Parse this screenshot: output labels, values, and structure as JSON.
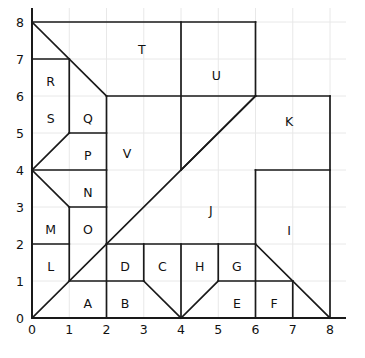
{
  "figure": {
    "title": "",
    "type": "partition-diagram",
    "background_color": "#ffffff",
    "line_color": "#1a1a1a",
    "grid_color": "#e8e8e8",
    "label_color": "#111111"
  },
  "axes": {
    "x": {
      "min": 0,
      "max": 8,
      "ticks": [
        0,
        1,
        2,
        3,
        4,
        5,
        6,
        7,
        8
      ],
      "tick_labels": [
        "0",
        "1",
        "2",
        "3",
        "4",
        "5",
        "6",
        "7",
        "8"
      ],
      "label": ""
    },
    "y": {
      "min": 0,
      "max": 8,
      "ticks": [
        0,
        1,
        2,
        3,
        4,
        5,
        6,
        7,
        8
      ],
      "tick_labels": [
        "0",
        "1",
        "2",
        "3",
        "4",
        "5",
        "6",
        "7",
        "8"
      ],
      "label": ""
    },
    "grid": true
  },
  "chart_data": {
    "type": "diagram",
    "title": "",
    "xlabel": "",
    "ylabel": "",
    "xlim": [
      0,
      8
    ],
    "ylim": [
      0,
      8
    ],
    "grid": true,
    "regions": [
      {
        "id": "A",
        "label": "A",
        "label_x": 1.5,
        "label_y": 0.5,
        "polygon": [
          [
            1,
            1
          ],
          [
            2,
            1
          ],
          [
            2,
            0
          ],
          [
            1,
            0
          ]
        ]
      },
      {
        "id": "B",
        "label": "B",
        "label_x": 2.5,
        "label_y": 0.5,
        "polygon": [
          [
            2,
            1
          ],
          [
            3,
            1
          ],
          [
            3,
            0
          ],
          [
            2,
            0
          ]
        ]
      },
      {
        "id": "C",
        "label": "C",
        "label_x": 3.5,
        "label_y": 1.5,
        "polygon": [
          [
            3,
            2
          ],
          [
            4,
            2
          ],
          [
            4,
            0
          ],
          [
            3,
            1
          ]
        ]
      },
      {
        "id": "D",
        "label": "D",
        "label_x": 2.5,
        "label_y": 1.5,
        "polygon": [
          [
            2,
            2
          ],
          [
            3,
            2
          ],
          [
            3,
            1
          ],
          [
            2,
            1
          ]
        ]
      },
      {
        "id": "E",
        "label": "E",
        "label_x": 5.5,
        "label_y": 0.5,
        "polygon": [
          [
            5,
            1
          ],
          [
            6,
            1
          ],
          [
            6,
            0
          ],
          [
            5,
            0
          ]
        ]
      },
      {
        "id": "F",
        "label": "F",
        "label_x": 6.5,
        "label_y": 0.5,
        "polygon": [
          [
            6,
            1
          ],
          [
            7,
            1
          ],
          [
            7,
            0
          ],
          [
            6,
            0
          ]
        ]
      },
      {
        "id": "G",
        "label": "G",
        "label_x": 5.5,
        "label_y": 1.5,
        "polygon": [
          [
            5,
            2
          ],
          [
            6,
            2
          ],
          [
            6,
            1
          ],
          [
            5,
            1
          ]
        ]
      },
      {
        "id": "H",
        "label": "H",
        "label_x": 4.5,
        "label_y": 1.5,
        "polygon": [
          [
            4,
            2
          ],
          [
            5,
            2
          ],
          [
            5,
            1
          ],
          [
            4,
            0
          ]
        ]
      },
      {
        "id": "I",
        "label": "I",
        "label_x": 6.9,
        "label_y": 2.45,
        "polygon": [
          [
            6,
            4
          ],
          [
            8,
            4
          ],
          [
            8,
            0
          ],
          [
            6,
            2
          ]
        ]
      },
      {
        "id": "J",
        "label": "J",
        "label_x": 4.8,
        "label_y": 3.0,
        "polygon": [
          [
            4,
            4
          ],
          [
            6,
            4
          ],
          [
            6,
            2
          ],
          [
            2,
            2
          ]
        ]
      },
      {
        "id": "K",
        "label": "K",
        "label_x": 6.9,
        "label_y": 5.4,
        "polygon": [
          [
            6,
            6
          ],
          [
            8,
            6
          ],
          [
            8,
            4
          ],
          [
            6,
            4
          ]
        ]
      },
      {
        "id": "L",
        "label": "L",
        "label_x": 0.5,
        "label_y": 1.5,
        "polygon": [
          [
            0,
            2
          ],
          [
            1,
            2
          ],
          [
            1,
            1
          ],
          [
            0,
            0
          ]
        ]
      },
      {
        "id": "M",
        "label": "M",
        "label_x": 0.5,
        "label_y": 2.5,
        "polygon": [
          [
            0,
            3
          ],
          [
            1,
            3
          ],
          [
            1,
            2
          ],
          [
            0,
            2
          ]
        ]
      },
      {
        "id": "N",
        "label": "N",
        "label_x": 1.5,
        "label_y": 3.5,
        "polygon": [
          [
            1,
            4
          ],
          [
            2,
            4
          ],
          [
            2,
            3
          ],
          [
            1,
            3
          ]
        ]
      },
      {
        "id": "O",
        "label": "O",
        "label_x": 1.5,
        "label_y": 2.5,
        "polygon": [
          [
            1,
            3
          ],
          [
            2,
            3
          ],
          [
            2,
            2
          ],
          [
            1,
            2
          ]
        ]
      },
      {
        "id": "P",
        "label": "P",
        "label_x": 1.5,
        "label_y": 4.5,
        "polygon": [
          [
            1,
            5
          ],
          [
            2,
            5
          ],
          [
            2,
            4
          ],
          [
            1,
            4
          ]
        ]
      },
      {
        "id": "Q",
        "label": "Q",
        "label_x": 1.5,
        "label_y": 5.5,
        "polygon": [
          [
            1,
            6
          ],
          [
            2,
            6
          ],
          [
            2,
            5
          ],
          [
            1,
            5
          ]
        ]
      },
      {
        "id": "R",
        "label": "R",
        "label_x": 0.5,
        "label_y": 6.5,
        "polygon": [
          [
            0,
            7
          ],
          [
            1,
            7
          ],
          [
            1,
            6
          ],
          [
            0,
            6
          ]
        ]
      },
      {
        "id": "S",
        "label": "S",
        "label_x": 0.5,
        "label_y": 5.5,
        "polygon": [
          [
            0,
            6
          ],
          [
            1,
            6
          ],
          [
            1,
            5
          ],
          [
            0,
            4
          ]
        ]
      },
      {
        "id": "T",
        "label": "T",
        "label_x": 2.95,
        "label_y": 7.35,
        "polygon": [
          [
            0,
            8
          ],
          [
            6,
            8
          ],
          [
            6,
            6
          ],
          [
            2,
            6
          ]
        ]
      },
      {
        "id": "U",
        "label": "U",
        "label_x": 4.95,
        "label_y": 6.65,
        "polygon": [
          [
            4,
            8
          ],
          [
            6,
            8
          ],
          [
            6,
            6
          ],
          [
            4,
            6
          ]
        ]
      },
      {
        "id": "V",
        "label": "V",
        "label_x": 2.55,
        "label_y": 4.55,
        "polygon": [
          [
            2,
            6
          ],
          [
            4,
            6
          ],
          [
            4,
            4
          ],
          [
            2,
            2
          ]
        ]
      }
    ],
    "segments": [
      {
        "name": "left-border",
        "from": [
          0,
          0
        ],
        "to": [
          0,
          8
        ]
      },
      {
        "name": "bottom-border",
        "from": [
          0,
          0
        ],
        "to": [
          8,
          0
        ]
      },
      {
        "name": "top-border",
        "from": [
          0,
          8
        ],
        "to": [
          6,
          8
        ]
      },
      {
        "name": "main-diagonal",
        "from": [
          0,
          0
        ],
        "to": [
          6,
          6
        ]
      },
      {
        "name": "upper-left-diagonal",
        "from": [
          0,
          8
        ],
        "to": [
          2,
          6
        ]
      },
      {
        "name": "s-diagonal",
        "from": [
          0,
          4
        ],
        "to": [
          1,
          5
        ]
      },
      {
        "name": "m-diagonal",
        "from": [
          0,
          4
        ],
        "to": [
          1,
          3
        ]
      },
      {
        "name": "c-diagonal",
        "from": [
          3,
          1
        ],
        "to": [
          4,
          0
        ]
      },
      {
        "name": "h-diagonal",
        "from": [
          4,
          0
        ],
        "to": [
          5,
          1
        ]
      },
      {
        "name": "i-diagonal",
        "from": [
          6,
          2
        ],
        "to": [
          8,
          0
        ]
      },
      {
        "name": "k-diagonal",
        "from": [
          4,
          4
        ],
        "to": [
          6,
          6
        ]
      },
      {
        "name": "h-line-y6-left",
        "from": [
          2,
          6
        ],
        "to": [
          6,
          6
        ]
      },
      {
        "name": "h-line-y6-right",
        "from": [
          6,
          6
        ],
        "to": [
          8,
          6
        ]
      },
      {
        "name": "h-line-y7",
        "from": [
          0,
          7
        ],
        "to": [
          1,
          7
        ]
      },
      {
        "name": "h-line-y5",
        "from": [
          1,
          5
        ],
        "to": [
          2,
          5
        ]
      },
      {
        "name": "h-line-y4-left",
        "from": [
          0,
          4
        ],
        "to": [
          2,
          4
        ]
      },
      {
        "name": "h-line-y4-right",
        "from": [
          6,
          4
        ],
        "to": [
          8,
          4
        ]
      },
      {
        "name": "h-line-y3",
        "from": [
          1,
          3
        ],
        "to": [
          2,
          3
        ]
      },
      {
        "name": "h-line-y2-left",
        "from": [
          0,
          2
        ],
        "to": [
          1,
          2
        ]
      },
      {
        "name": "h-line-y2-mid",
        "from": [
          2,
          2
        ],
        "to": [
          6,
          2
        ]
      },
      {
        "name": "h-line-y1-left",
        "from": [
          1,
          1
        ],
        "to": [
          3,
          1
        ]
      },
      {
        "name": "h-line-y1-right",
        "from": [
          5,
          1
        ],
        "to": [
          7,
          1
        ]
      },
      {
        "name": "v-line-x1-upper",
        "from": [
          1,
          7
        ],
        "to": [
          1,
          5
        ]
      },
      {
        "name": "v-line-x1-lower",
        "from": [
          1,
          3
        ],
        "to": [
          1,
          1
        ]
      },
      {
        "name": "v-line-x2-upper",
        "from": [
          2,
          6
        ],
        "to": [
          2,
          2
        ]
      },
      {
        "name": "v-line-x2-lower",
        "from": [
          2,
          2
        ],
        "to": [
          2,
          0
        ]
      },
      {
        "name": "v-line-x3",
        "from": [
          3,
          2
        ],
        "to": [
          3,
          1
        ]
      },
      {
        "name": "v-line-x4-upper",
        "from": [
          4,
          8
        ],
        "to": [
          4,
          4
        ]
      },
      {
        "name": "v-line-x4-lower",
        "from": [
          4,
          2
        ],
        "to": [
          4,
          0
        ]
      },
      {
        "name": "v-line-x5",
        "from": [
          5,
          2
        ],
        "to": [
          5,
          1
        ]
      },
      {
        "name": "v-line-x6-upper",
        "from": [
          6,
          8
        ],
        "to": [
          6,
          6
        ]
      },
      {
        "name": "v-line-x6-lower",
        "from": [
          6,
          4
        ],
        "to": [
          6,
          0
        ]
      },
      {
        "name": "v-line-x7",
        "from": [
          7,
          1
        ],
        "to": [
          7,
          0
        ]
      },
      {
        "name": "v-line-x8",
        "from": [
          8,
          6
        ],
        "to": [
          8,
          0
        ]
      }
    ]
  }
}
